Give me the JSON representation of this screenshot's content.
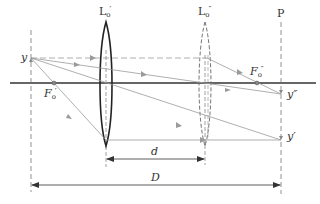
{
  "diagram": {
    "type": "optical-ray-diagram",
    "labels": {
      "lens1": {
        "base": "L",
        "sub": "o",
        "sup": "′"
      },
      "lens2": {
        "base": "L",
        "sub": "o",
        "sup": "″"
      },
      "plane": "P",
      "object": "y",
      "focus1": {
        "base": "F",
        "sub": "o",
        "sup": "′"
      },
      "focus2": {
        "base": "F",
        "sub": "o",
        "sup": "″"
      },
      "image2": "y″",
      "image1": "y′",
      "dim_small": "d",
      "dim_large": "D"
    },
    "colors": {
      "axis": "#333333",
      "lens1": "#222222",
      "lens2": "#666666",
      "ray": "#9a9a9a",
      "dashed": "#777777",
      "dimension": "#333333",
      "background": "#ffffff"
    },
    "geometry": {
      "axis_y": 83,
      "object_plane_x": 31,
      "lens1_x": 106,
      "lens2_x": 205,
      "plane_p_x": 281,
      "object_point": [
        31,
        58
      ],
      "focus1_point": [
        54,
        83
      ],
      "focus2_point": [
        257,
        83
      ],
      "image2_point": [
        281,
        94
      ],
      "image1_point": [
        281,
        140
      ],
      "dim_small_y": 159,
      "dim_large_y": 185
    }
  }
}
